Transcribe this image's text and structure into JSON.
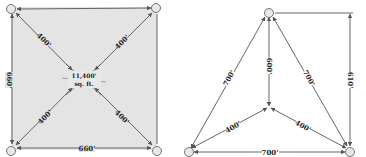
{
  "colors": {
    "square_fill": "#e4e4e4",
    "line": "#555555",
    "text": "#222222",
    "node_fill": "#e8e8e8",
    "node_stroke": "#666666"
  },
  "square_diagram": {
    "top_side": "",
    "left_side": "660'",
    "bottom_side": "660'",
    "diag_top_left": "400'",
    "diag_top_right": "400'",
    "diag_bottom_left": "400'",
    "diag_bottom_right": "400'",
    "area_line1": "11,400'",
    "area_line2": "sq. ft."
  },
  "triangle_diagram": {
    "left_side": "700'",
    "right_side": "700'",
    "bottom_side": "700'",
    "center_vertical": "600'",
    "center_left": "400'",
    "center_right": "400'",
    "height": "610'"
  }
}
